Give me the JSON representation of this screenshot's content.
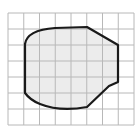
{
  "diagram": {
    "type": "grid-area-shape",
    "grid": {
      "columns": 8,
      "rows": 7,
      "origin_x": 8,
      "origin_y": 13,
      "cell_width": 15.75,
      "cell_height": 16,
      "line_color": "#b8b8b8"
    },
    "shape": {
      "fill": "#ececec",
      "stroke": "#1a1a1a",
      "stroke_width": 2.2,
      "path": "M25,44 Q27,30 55,28 L87,27 L118,45 L118,82 L109,86 L87,107 Q60,112 40,104 Q30,100 25,93 Z"
    }
  }
}
